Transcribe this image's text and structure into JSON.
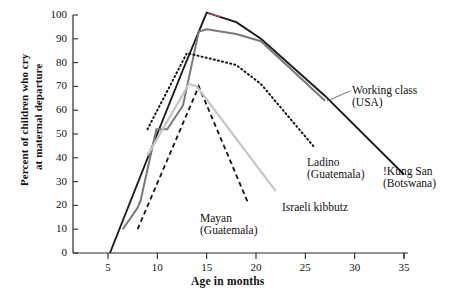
{
  "chart_data": {
    "type": "line",
    "title": "",
    "subtitle": "",
    "xlabel": "Age in months",
    "ylabel": "Percent of children who cry\nat maternal departure",
    "ylabel_line1": "Percent of children who cry",
    "ylabel_line2": "at maternal departure",
    "xlim": [
      0,
      36
    ],
    "ylim": [
      0,
      100
    ],
    "xticks": [
      5,
      10,
      15,
      20,
      25,
      30,
      35
    ],
    "yticks": [
      0,
      10,
      20,
      30,
      40,
      50,
      60,
      70,
      80,
      90,
      100
    ],
    "grid": false,
    "legend_position": "inline-annotations",
    "series": [
      {
        "name": "!Kung San (Botswana)",
        "label_line1": "!Kung San",
        "label_line2": "(Botswana)",
        "style": "solid",
        "color": "#1a1a1a",
        "width": 1.9,
        "points": [
          {
            "x": 5.2,
            "y": 0
          },
          {
            "x": 9.6,
            "y": 46
          },
          {
            "x": 12.6,
            "y": 77
          },
          {
            "x": 15.0,
            "y": 101
          },
          {
            "x": 18.0,
            "y": 97
          },
          {
            "x": 20.5,
            "y": 90
          },
          {
            "x": 27.0,
            "y": 66
          },
          {
            "x": 35.0,
            "y": 33
          }
        ]
      },
      {
        "name": "Working class (USA)",
        "label_line1": "Working class",
        "label_line2": "(USA)",
        "style": "solid",
        "color": "#787878",
        "width": 2.0,
        "points": [
          {
            "x": 6.5,
            "y": 10
          },
          {
            "x": 8.0,
            "y": 19
          },
          {
            "x": 8.3,
            "y": 22
          },
          {
            "x": 9.9,
            "y": 52
          },
          {
            "x": 11.0,
            "y": 52
          },
          {
            "x": 12.6,
            "y": 62
          },
          {
            "x": 14.2,
            "y": 93
          },
          {
            "x": 15.0,
            "y": 94
          },
          {
            "x": 18.0,
            "y": 92
          },
          {
            "x": 20.5,
            "y": 89
          },
          {
            "x": 27.0,
            "y": 64
          }
        ]
      },
      {
        "name": "Ladino (Guatemala)",
        "label_line1": "Ladino",
        "label_line2": "(Guatemala)",
        "style": "dotted",
        "color": "#111111",
        "width": 2.0,
        "points": [
          {
            "x": 9.0,
            "y": 52
          },
          {
            "x": 13.0,
            "y": 84
          },
          {
            "x": 18.0,
            "y": 79
          },
          {
            "x": 20.5,
            "y": 71
          },
          {
            "x": 26.0,
            "y": 44
          }
        ]
      },
      {
        "name": "Mayan (Guatemala)",
        "label_line1": "Mayan",
        "label_line2": "(Guatemala)",
        "style": "dashed",
        "color": "#111111",
        "width": 1.8,
        "points": [
          {
            "x": 8.0,
            "y": 10
          },
          {
            "x": 14.2,
            "y": 70
          },
          {
            "x": 19.2,
            "y": 21
          }
        ]
      },
      {
        "name": "Israeli kibbutz",
        "label_line1": "Israeli kibbutz",
        "label_line2": "",
        "style": "solid",
        "color": "#c4c4c4",
        "width": 2.2,
        "points": [
          {
            "x": 9.0,
            "y": 41
          },
          {
            "x": 13.2,
            "y": 71
          },
          {
            "x": 14.0,
            "y": 70
          },
          {
            "x": 22.0,
            "y": 26
          }
        ]
      }
    ],
    "annotations": [
      {
        "text": "Working class",
        "text2": "(USA)",
        "for": "!Kung San (Botswana)"
      },
      {
        "text": "Ladino",
        "text2": "(Guatemala)",
        "for": "Ladino (Guatemala)"
      },
      {
        "text": "!Kung San",
        "text2": "(Botswana)",
        "for": "!Kung San (Botswana)"
      },
      {
        "text": "Mayan",
        "text2": "(Guatemala)",
        "for": "Mayan (Guatemala)"
      },
      {
        "text": "Israeli kibbutz",
        "text2": "",
        "for": "Israeli kibbutz"
      }
    ]
  },
  "axis": {
    "x_tick_labels": [
      "5",
      "10",
      "15",
      "20",
      "25",
      "30",
      "35"
    ],
    "y_tick_labels": [
      "0",
      "10",
      "20",
      "30",
      "40",
      "50",
      "60",
      "70",
      "80",
      "90",
      "100"
    ],
    "x_title": "Age in months",
    "y_title_line1": "Percent of children who cry",
    "y_title_line2": "at maternal departure"
  },
  "labels": {
    "working_class_1": "Working class",
    "working_class_2": "(USA)",
    "ladino_1": "Ladino",
    "ladino_2": "(Guatemala)",
    "kungsan_1": "!Kung San",
    "kungsan_2": "(Botswana)",
    "mayan_1": "Mayan",
    "mayan_2": "(Guatemala)",
    "kibbutz_1": "Israeli kibbutz"
  },
  "colors": {
    "kungsan": "#1a1a1a",
    "working_class": "#787878",
    "ladino": "#111111",
    "mayan": "#111111",
    "kibbutz": "#c4c4c4",
    "axis": "#2b2b2b",
    "background": "#ffffff"
  }
}
